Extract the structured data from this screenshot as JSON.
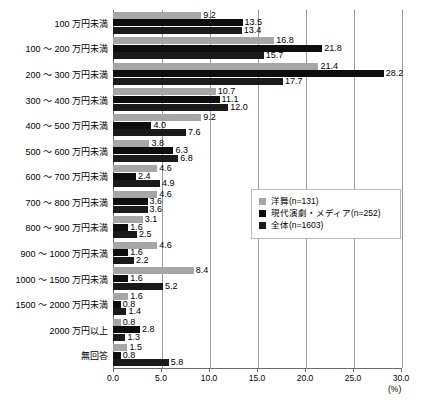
{
  "chart_data": {
    "type": "bar",
    "orientation": "horizontal",
    "title": "",
    "xlabel": "(%)",
    "ylabel": "",
    "xlim": [
      0,
      30
    ],
    "grid": true,
    "legend_position": "center-right",
    "xticks": [
      "0.0",
      "5.0",
      "10.0",
      "15.0",
      "20.0",
      "25.0",
      "30.0"
    ],
    "xtick_values": [
      0,
      5,
      10,
      15,
      20,
      25,
      30
    ],
    "categories": [
      "100 万円未満",
      "100 ～ 200 万円未満",
      "200 ～ 300 万円未満",
      "300 ～ 400 万円未満",
      "400 ～ 500 万円未満",
      "500 ～ 600 万円未満",
      "600 ～ 700 万円未満",
      "700 ～ 800 万円未満",
      "800 ～ 900 万円未満",
      "900 ～ 1000 万円未満",
      "1000 ～ 1500 万円未満",
      "1500 ～ 2000 万円未満",
      "2000 万円以上",
      "無回答"
    ],
    "series": [
      {
        "name": "洋舞(n=131)",
        "color": "#a6a6a6",
        "values": [
          9.2,
          16.8,
          21.4,
          10.7,
          9.2,
          3.8,
          4.6,
          4.6,
          3.1,
          4.6,
          8.4,
          1.6,
          0.8,
          1.5
        ]
      },
      {
        "name": "現代演劇・メディア(n=252)",
        "color": "#0d0d0d",
        "values": [
          13.5,
          21.8,
          28.2,
          11.1,
          4.0,
          6.3,
          2.4,
          3.6,
          1.6,
          1.6,
          1.6,
          0.8,
          2.8,
          0.8
        ]
      },
      {
        "name": "全体(n=1603)",
        "color": "#1a1a1a",
        "values": [
          13.4,
          15.7,
          17.7,
          12.0,
          7.6,
          6.8,
          4.9,
          3.6,
          2.5,
          2.2,
          5.2,
          1.4,
          1.3,
          5.8
        ]
      }
    ]
  },
  "legend": {
    "items": [
      {
        "label": "洋舞(n=131)",
        "color": "#a6a6a6"
      },
      {
        "label": "現代演劇・メディア(n=252)",
        "color": "#0d0d0d"
      },
      {
        "label": "全体(n=1603)",
        "color": "#1a1a1a"
      }
    ]
  },
  "axis": {
    "unit": "(%)"
  }
}
